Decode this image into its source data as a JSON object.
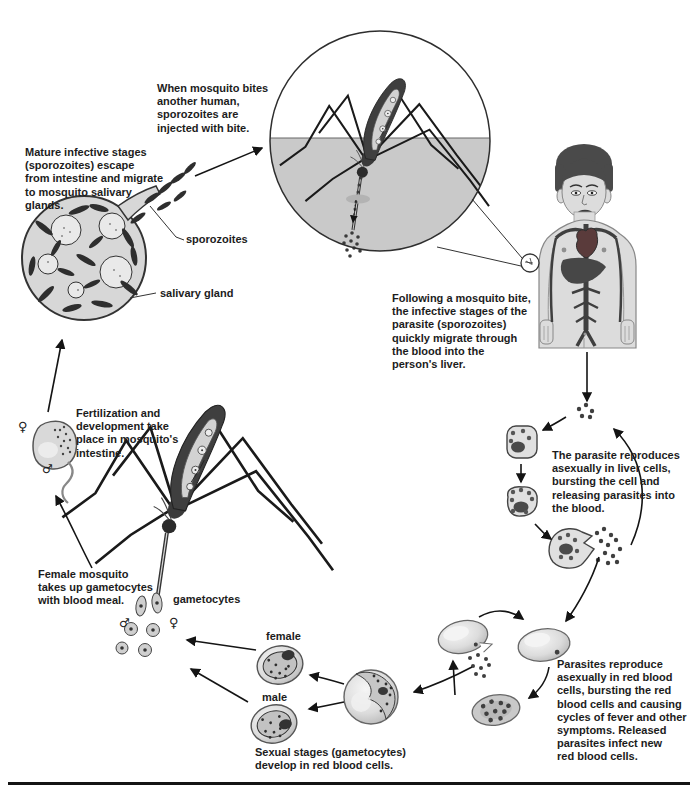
{
  "annotations": {
    "when_bite": "When mosquito bites\nanother human,\nsporozoites are\ninjected with bite.",
    "mature_stages": "Mature infective stages\n(sporozoites) escape\nfrom intestine and migrate\nto mosquito salivary\nglands.",
    "following_bite": "Following a mosquito bite,\nthe infective stages of the\nparasite (sporozoites)\nquickly migrate through\nthe blood into the\nperson's liver.",
    "fertilization": "Fertilization and\ndevelopment take\nplace in mosquito's\nintestine.",
    "female_mosquito": "Female mosquito\ntakes up gametocytes\nwith blood meal.",
    "liver_reproduction": "The parasite reproduces\nasexually in liver cells,\nbursting the cell and\nreleasing parasites into\nthe blood.",
    "rbc_reproduction": "Parasites reproduce\nasexually in red blood\ncells, bursting the red\nblood cells and causing\ncycles of fever and other\nsymptoms. Released\nparasites infect new\nred blood cells.",
    "sexual_stages": "Sexual stages (gametocytes)\ndevelop in red blood cells."
  },
  "labels": {
    "sporozoites": "sporozoites",
    "salivary_gland": "salivary gland",
    "gametocytes": "gametocytes",
    "female": "female",
    "male": "male"
  },
  "symbols": {
    "female": "♀",
    "male": "♂"
  },
  "colors": {
    "ink": "#1c1c1c",
    "skin_in_circle": "#c9c9c9",
    "body_fill": "#dcdcdc",
    "mosquito_dark": "#3f3f3f",
    "cell_fill": "#e0e0e0",
    "heart": "#5a3b3b",
    "bottom_rule": "#141414"
  }
}
